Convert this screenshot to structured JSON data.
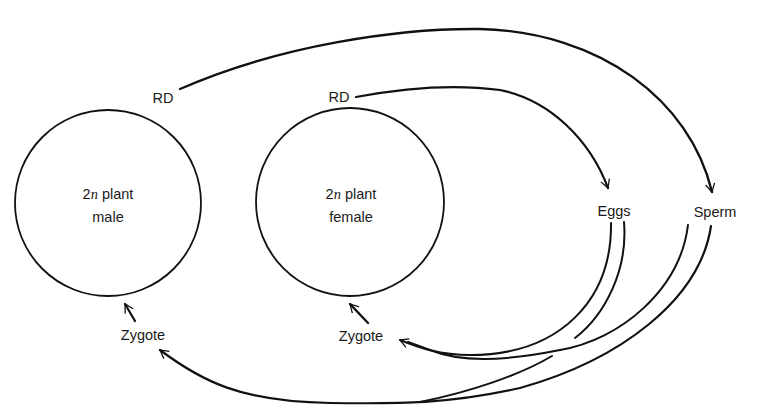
{
  "diagram": {
    "type": "life-cycle",
    "nodes": {
      "male_plant": {
        "line1_prefix": "2",
        "line1_var": "n",
        "line1_suffix": " plant",
        "line2": "male"
      },
      "female_plant": {
        "line1_prefix": "2",
        "line1_var": "n",
        "line1_suffix": " plant",
        "line2": "female"
      },
      "rd_male": "RD",
      "rd_female": "RD",
      "eggs": "Eggs",
      "sperm": "Sperm",
      "zygote_male": "Zygote",
      "zygote_female": "Zygote"
    },
    "edges": [
      {
        "from": "RD (male plant)",
        "to": "Sperm"
      },
      {
        "from": "RD (female plant)",
        "to": "Eggs"
      },
      {
        "from": "Eggs",
        "to": "Zygote (female)"
      },
      {
        "from": "Sperm",
        "to": "Zygote (female)"
      },
      {
        "from": "Eggs",
        "to": "Zygote (male)"
      },
      {
        "from": "Sperm",
        "to": "Zygote (male)"
      },
      {
        "from": "Zygote (male)",
        "to": "2n plant male"
      },
      {
        "from": "Zygote (female)",
        "to": "2n plant female"
      }
    ],
    "colors": {
      "line": "#111111",
      "text": "#1a1a1a",
      "background": "#ffffff"
    }
  }
}
